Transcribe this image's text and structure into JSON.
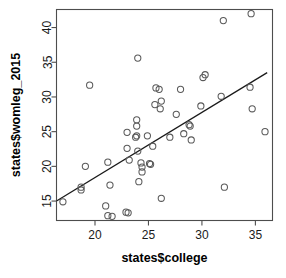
{
  "chart_data": {
    "type": "scatter",
    "title": "",
    "xlabel": "states$college",
    "ylabel": "states$womleg_2015",
    "xlim": [
      16.4,
      36.6
    ],
    "ylim": [
      12.2,
      42.6
    ],
    "xticks": [
      20,
      25,
      30,
      35
    ],
    "yticks": [
      15,
      20,
      25,
      30,
      35,
      40
    ],
    "grid": false,
    "legend": false,
    "points": [
      [
        17.0,
        14.9
      ],
      [
        18.7,
        16.6
      ],
      [
        18.7,
        17.0
      ],
      [
        19.1,
        20.0
      ],
      [
        19.5,
        31.7
      ],
      [
        21.0,
        14.3
      ],
      [
        21.2,
        12.9
      ],
      [
        21.2,
        20.6
      ],
      [
        21.4,
        17.3
      ],
      [
        21.6,
        12.8
      ],
      [
        22.9,
        13.4
      ],
      [
        23.0,
        22.6
      ],
      [
        23.0,
        24.9
      ],
      [
        23.1,
        13.3
      ],
      [
        23.2,
        20.9
      ],
      [
        23.8,
        24.2
      ],
      [
        23.9,
        25.8
      ],
      [
        23.9,
        26.7
      ],
      [
        23.9,
        24.4
      ],
      [
        24.0,
        22.2
      ],
      [
        24.0,
        35.6
      ],
      [
        24.1,
        17.8
      ],
      [
        24.3,
        20.5
      ],
      [
        24.4,
        19.2
      ],
      [
        24.4,
        19.9
      ],
      [
        24.9,
        24.4
      ],
      [
        25.1,
        20.4
      ],
      [
        25.2,
        20.3
      ],
      [
        25.4,
        22.9
      ],
      [
        25.6,
        28.9
      ],
      [
        25.7,
        31.3
      ],
      [
        26.0,
        31.1
      ],
      [
        26.1,
        28.3
      ],
      [
        26.2,
        29.4
      ],
      [
        26.2,
        15.4
      ],
      [
        27.0,
        24.2
      ],
      [
        27.6,
        27.5
      ],
      [
        28.0,
        31.1
      ],
      [
        28.3,
        24.7
      ],
      [
        28.8,
        26.0
      ],
      [
        28.9,
        25.8
      ],
      [
        29.0,
        23.8
      ],
      [
        29.9,
        28.7
      ],
      [
        30.1,
        32.8
      ],
      [
        30.3,
        33.2
      ],
      [
        31.8,
        30.1
      ],
      [
        32.0,
        41.0
      ],
      [
        32.1,
        17.0
      ],
      [
        34.5,
        31.4
      ],
      [
        34.6,
        42.0
      ],
      [
        34.7,
        28.3
      ],
      [
        35.9,
        25.0
      ]
    ],
    "regression_line": {
      "x_start": 16.4,
      "y_start": 15.0,
      "x_end": 36.1,
      "y_end": 33.5
    }
  }
}
